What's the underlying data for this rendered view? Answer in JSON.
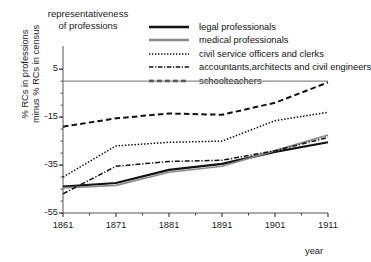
{
  "chart_data": {
    "type": "line",
    "title": "representativeness\nof professions",
    "xlabel": "year",
    "ylabel": "% RCs in professions\nminus % RCs in census",
    "xlim": [
      1861,
      1911
    ],
    "ylim": [
      -55,
      8
    ],
    "xticks": [
      1861,
      1871,
      1881,
      1891,
      1901,
      1911
    ],
    "xtick_labels": [
      "1861",
      "1871",
      "1881",
      "1891",
      "1901",
      "1911"
    ],
    "xminor_step": 5,
    "yticks": [
      5,
      -15,
      -35,
      -55
    ],
    "ytick_labels": [
      "5",
      "-15",
      "-35",
      "-55"
    ],
    "grid": false,
    "zero_line": 0,
    "legend_position": "top-right",
    "x": [
      1861,
      1871,
      1881,
      1891,
      1901,
      1911
    ],
    "series": [
      {
        "name": "legal professionals",
        "style": "solid",
        "color": "#111111",
        "width": 2.1,
        "values": [
          -44.0,
          -42.5,
          -37.0,
          -34.5,
          -29.5,
          -25.5
        ]
      },
      {
        "name": "medical professionals",
        "style": "solid",
        "color": "#8a8a8a",
        "width": 1.7,
        "values": [
          -44.5,
          -43.5,
          -38.0,
          -35.5,
          -29.0,
          -22.5
        ]
      },
      {
        "name": "civil service officers and clerks",
        "style": "dotted",
        "color": "#111111",
        "width": 1.5,
        "values": [
          -40.0,
          -27.0,
          -25.5,
          -25.0,
          -16.5,
          -13.0
        ]
      },
      {
        "name": "accountants,architects and civil engineers",
        "style": "dashdot",
        "color": "#111111",
        "width": 1.5,
        "values": [
          -47.0,
          -35.5,
          -33.5,
          -33.0,
          -29.0,
          -23.5
        ]
      },
      {
        "name": "schoolteachers",
        "style": "dashed",
        "color": "#111111",
        "width": 2.0,
        "values": [
          -19.0,
          -15.5,
          -13.5,
          -14.0,
          -9.0,
          -0.5
        ]
      }
    ]
  }
}
